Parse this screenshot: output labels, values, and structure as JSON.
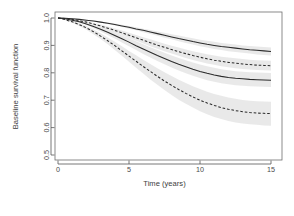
{
  "chart_data": {
    "type": "line",
    "title": "",
    "xlabel": "Time (years)",
    "ylabel": "Baseline survival function",
    "xlim": [
      0,
      15
    ],
    "ylim": [
      0.5,
      1.0
    ],
    "xticks": [
      0,
      5,
      10,
      15
    ],
    "xticklabels": [
      "0",
      "5",
      "10",
      "15"
    ],
    "yticks": [
      0.5,
      0.6,
      0.7,
      0.8,
      0.9,
      1.0
    ],
    "yticklabels": [
      "0.5",
      "0.6",
      "0.7",
      "0.8",
      "0.9",
      "1.0"
    ],
    "grid": false,
    "legend": "none",
    "band_color": "#d9d9d9",
    "line_color": "#2b2b2b",
    "x": [
      0,
      0.5,
      1,
      1.5,
      2,
      2.5,
      3,
      3.5,
      4,
      4.5,
      5,
      5.5,
      6,
      6.5,
      7,
      7.5,
      8,
      8.5,
      9,
      9.5,
      10,
      10.5,
      11,
      11.5,
      12,
      12.5,
      13,
      13.5,
      14,
      14.5,
      15
    ],
    "series": [
      {
        "name": "curve-1",
        "style": "solid",
        "has_band": true,
        "values": [
          1.0,
          0.999,
          0.997,
          0.995,
          0.992,
          0.989,
          0.985,
          0.981,
          0.976,
          0.971,
          0.966,
          0.96,
          0.955,
          0.949,
          0.943,
          0.937,
          0.931,
          0.925,
          0.92,
          0.914,
          0.909,
          0.904,
          0.9,
          0.896,
          0.893,
          0.89,
          0.887,
          0.884,
          0.882,
          0.88,
          0.878
        ],
        "lower": [
          1.0,
          0.999,
          0.997,
          0.994,
          0.991,
          0.987,
          0.983,
          0.978,
          0.973,
          0.967,
          0.961,
          0.955,
          0.948,
          0.942,
          0.935,
          0.928,
          0.922,
          0.915,
          0.909,
          0.903,
          0.897,
          0.892,
          0.887,
          0.883,
          0.879,
          0.876,
          0.873,
          0.87,
          0.867,
          0.865,
          0.863
        ],
        "upper": [
          1.0,
          1.0,
          0.998,
          0.996,
          0.994,
          0.991,
          0.988,
          0.984,
          0.98,
          0.975,
          0.971,
          0.966,
          0.961,
          0.956,
          0.951,
          0.946,
          0.941,
          0.936,
          0.931,
          0.926,
          0.921,
          0.917,
          0.913,
          0.909,
          0.906,
          0.903,
          0.9,
          0.898,
          0.896,
          0.894,
          0.892
        ]
      },
      {
        "name": "curve-2",
        "style": "dashed",
        "has_band": true,
        "values": [
          1.0,
          0.998,
          0.995,
          0.99,
          0.985,
          0.978,
          0.971,
          0.963,
          0.955,
          0.946,
          0.937,
          0.928,
          0.919,
          0.91,
          0.901,
          0.893,
          0.885,
          0.877,
          0.87,
          0.863,
          0.857,
          0.851,
          0.846,
          0.842,
          0.838,
          0.835,
          0.832,
          0.83,
          0.828,
          0.827,
          0.826
        ],
        "lower": [
          1.0,
          0.997,
          0.993,
          0.988,
          0.981,
          0.974,
          0.965,
          0.956,
          0.947,
          0.937,
          0.927,
          0.917,
          0.907,
          0.897,
          0.888,
          0.879,
          0.87,
          0.862,
          0.854,
          0.847,
          0.84,
          0.834,
          0.829,
          0.824,
          0.82,
          0.817,
          0.814,
          0.812,
          0.81,
          0.809,
          0.808
        ],
        "upper": [
          1.0,
          0.999,
          0.996,
          0.992,
          0.988,
          0.982,
          0.976,
          0.969,
          0.962,
          0.954,
          0.946,
          0.938,
          0.93,
          0.922,
          0.914,
          0.906,
          0.899,
          0.892,
          0.885,
          0.879,
          0.873,
          0.868,
          0.863,
          0.859,
          0.856,
          0.853,
          0.85,
          0.848,
          0.846,
          0.845,
          0.844
        ]
      },
      {
        "name": "curve-3",
        "style": "solid",
        "has_band": true,
        "values": [
          1.0,
          0.997,
          0.992,
          0.986,
          0.978,
          0.969,
          0.959,
          0.948,
          0.936,
          0.924,
          0.912,
          0.899,
          0.887,
          0.875,
          0.863,
          0.852,
          0.841,
          0.831,
          0.822,
          0.813,
          0.805,
          0.798,
          0.792,
          0.787,
          0.783,
          0.78,
          0.778,
          0.776,
          0.775,
          0.774,
          0.773
        ],
        "lower": [
          1.0,
          0.996,
          0.99,
          0.983,
          0.974,
          0.963,
          0.951,
          0.938,
          0.925,
          0.911,
          0.897,
          0.883,
          0.869,
          0.856,
          0.843,
          0.831,
          0.819,
          0.808,
          0.798,
          0.789,
          0.781,
          0.773,
          0.767,
          0.762,
          0.758,
          0.755,
          0.753,
          0.751,
          0.75,
          0.749,
          0.748
        ],
        "upper": [
          1.0,
          0.998,
          0.994,
          0.989,
          0.982,
          0.974,
          0.966,
          0.957,
          0.947,
          0.936,
          0.926,
          0.915,
          0.904,
          0.893,
          0.883,
          0.873,
          0.863,
          0.854,
          0.846,
          0.838,
          0.83,
          0.824,
          0.818,
          0.813,
          0.809,
          0.806,
          0.804,
          0.802,
          0.801,
          0.8,
          0.799
        ]
      },
      {
        "name": "curve-4",
        "style": "dashed",
        "has_band": true,
        "values": [
          1.0,
          0.994,
          0.986,
          0.976,
          0.964,
          0.95,
          0.934,
          0.917,
          0.899,
          0.88,
          0.861,
          0.842,
          0.823,
          0.805,
          0.787,
          0.77,
          0.754,
          0.739,
          0.725,
          0.712,
          0.7,
          0.69,
          0.681,
          0.673,
          0.667,
          0.662,
          0.658,
          0.655,
          0.653,
          0.652,
          0.651
        ],
        "lower": [
          1.0,
          0.992,
          0.983,
          0.971,
          0.957,
          0.941,
          0.923,
          0.904,
          0.883,
          0.862,
          0.84,
          0.818,
          0.797,
          0.776,
          0.756,
          0.737,
          0.719,
          0.702,
          0.687,
          0.673,
          0.66,
          0.649,
          0.639,
          0.631,
          0.624,
          0.619,
          0.615,
          0.612,
          0.61,
          0.608,
          0.607
        ],
        "upper": [
          1.0,
          0.996,
          0.989,
          0.981,
          0.971,
          0.958,
          0.944,
          0.929,
          0.913,
          0.897,
          0.88,
          0.864,
          0.848,
          0.832,
          0.817,
          0.802,
          0.788,
          0.775,
          0.763,
          0.751,
          0.741,
          0.731,
          0.723,
          0.716,
          0.71,
          0.705,
          0.701,
          0.698,
          0.696,
          0.695,
          0.694
        ]
      }
    ]
  }
}
